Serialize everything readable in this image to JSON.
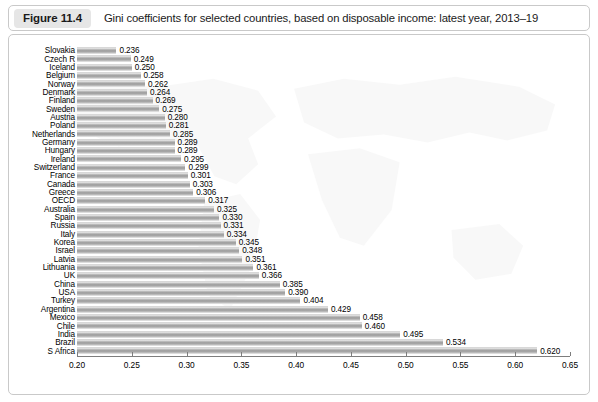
{
  "figure": {
    "badge": "Figure 11.4",
    "title": "Gini coefficients for selected countries, based on disposable income: latest year, 2013–19"
  },
  "chart_data": {
    "type": "bar",
    "orientation": "horizontal",
    "title": "Gini coefficients for selected countries, based on disposable income: latest year, 2013–19",
    "xlabel": "",
    "ylabel": "",
    "xlim": [
      0.2,
      0.65
    ],
    "xticks": [
      "0.20",
      "0.25",
      "0.30",
      "0.35",
      "0.40",
      "0.45",
      "0.50",
      "0.55",
      "0.60",
      "0.65"
    ],
    "grid": false,
    "legend": "none",
    "value_labels": true,
    "categories": [
      "Slovakia",
      "Czech R",
      "Iceland",
      "Belgium",
      "Norway",
      "Denmark",
      "Finland",
      "Sweden",
      "Austria",
      "Poland",
      "Netherlands",
      "Germany",
      "Hungary",
      "Ireland",
      "Switzerland",
      "France",
      "Canada",
      "Greece",
      "OECD",
      "Australia",
      "Spain",
      "Russia",
      "Italy",
      "Korea",
      "Israel",
      "Latvia",
      "Lithuania",
      "UK",
      "China",
      "USA",
      "Turkey",
      "Argentina",
      "Mexico",
      "Chile",
      "India",
      "Brazil",
      "S Africa"
    ],
    "values": [
      0.236,
      0.249,
      0.25,
      0.258,
      0.262,
      0.264,
      0.269,
      0.275,
      0.28,
      0.281,
      0.285,
      0.289,
      0.289,
      0.295,
      0.299,
      0.301,
      0.303,
      0.306,
      0.317,
      0.325,
      0.33,
      0.331,
      0.334,
      0.345,
      0.348,
      0.351,
      0.361,
      0.366,
      0.385,
      0.39,
      0.404,
      0.429,
      0.458,
      0.46,
      0.495,
      0.534,
      0.62
    ],
    "value_label_texts": [
      "0.236",
      "0.249",
      "0.250",
      "0.258",
      "0.262",
      "0.264",
      "0.269",
      "0.275",
      "0.280",
      "0.281",
      "0.285",
      "0.289",
      "0.289",
      "0.295",
      "0.299",
      "0.301",
      "0.303",
      "0.306",
      "0.317",
      "0.325",
      "0.330",
      "0.331",
      "0.334",
      "0.345",
      "0.348",
      "0.351",
      "0.361",
      "0.366",
      "0.385",
      "0.390",
      "0.404",
      "0.429",
      "0.458",
      "0.460",
      "0.495",
      "0.534",
      "0.620"
    ]
  },
  "colors": {
    "bar_mid": "#9a9a9a",
    "bar_light": "#ededed",
    "badge_bg": "#e6e6e6",
    "frame_border": "#c9c9c9",
    "axis": "#7d7d7d",
    "text": "#000000"
  }
}
